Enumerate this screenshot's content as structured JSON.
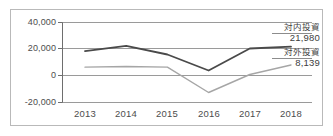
{
  "chart_data": {
    "type": "line",
    "title": "",
    "subtitle": "",
    "xlabel": "",
    "ylabel": "",
    "categories": [
      "2013",
      "2014",
      "2015",
      "2016",
      "2017",
      "2018"
    ],
    "ylim": [
      -20000,
      40000
    ],
    "yticks": [
      40000,
      20000,
      0,
      -20000
    ],
    "ytick_labels": [
      "40,000",
      "20,000",
      "0",
      "-20,000"
    ],
    "grid": true,
    "legend_position": "right-annotation",
    "series": [
      {
        "name": "対内投資",
        "color": "#4a4a4a",
        "values": [
          18500,
          22500,
          16000,
          4000,
          20500,
          21980
        ],
        "end_label": "21,980"
      },
      {
        "name": "対外投資",
        "color": "#a6a6a6",
        "values": [
          6500,
          7000,
          6500,
          -12500,
          1000,
          8139
        ],
        "end_label": "8,139"
      }
    ],
    "annotations": [
      {
        "name": "対内投資",
        "value": "21,980"
      },
      {
        "name": "対外投資",
        "value": "8,139"
      }
    ]
  },
  "colors": {
    "frame": "#b9b9b9",
    "grid": "#9a9a9a",
    "axis": "#6e6e6e",
    "text": "#4d4d4d",
    "series_inward": "#4a4a4a",
    "series_outward": "#a6a6a6",
    "background": "#ffffff"
  }
}
